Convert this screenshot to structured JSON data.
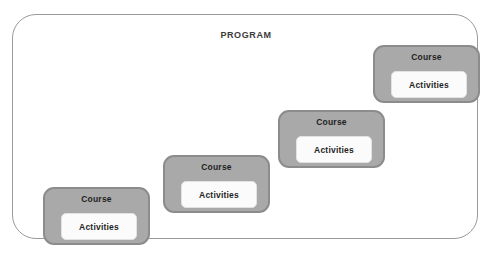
{
  "diagram": {
    "title": "PROGRAM",
    "container_label": "PROGRAM",
    "colors": {
      "page_background": "#ffffff",
      "container_border": "#9a9a9a",
      "container_fill": "#ffffff",
      "course_fill": "#a9a9a9",
      "course_border": "#8c8c8c",
      "activities_fill": "#fbfbfb",
      "activities_border": "#e2e2e2",
      "text": "#1f1f1f",
      "title_text": "#3a3a3a"
    },
    "courses": [
      {
        "label": "Course",
        "activities_label": "Activities",
        "position": "bottom-left",
        "x": 30,
        "y": 172
      },
      {
        "label": "Course",
        "activities_label": "Activities",
        "position": "lower-middle",
        "x": 150,
        "y": 140
      },
      {
        "label": "Course",
        "activities_label": "Activities",
        "position": "upper-middle",
        "x": 265,
        "y": 95
      },
      {
        "label": "Course",
        "activities_label": "Activities",
        "position": "top-right",
        "x": 360,
        "y": 30
      }
    ]
  }
}
